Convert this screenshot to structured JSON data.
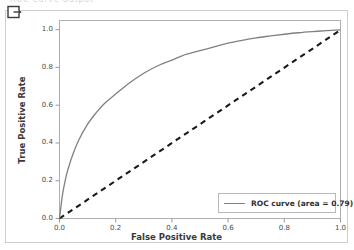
{
  "top_clip": {
    "ghost_text": "ROC Curve Output"
  },
  "toolbar": {
    "export_icon": "export-icon"
  },
  "colors": {
    "roc_curve": "#808080",
    "chance_line": "#1a1a1a",
    "frame": "#b0b0b0",
    "card_border": "#cfcfcf",
    "text": "#3a3a3a",
    "background": "#ffffff"
  },
  "chart_data": {
    "type": "line",
    "title": "",
    "xlabel": "False Positive Rate",
    "ylabel": "True Positive Rate",
    "xlim": [
      0.0,
      1.0
    ],
    "ylim": [
      0.0,
      1.05
    ],
    "grid": false,
    "legend_position": "lower right",
    "xticks": [
      "0.0",
      "0.2",
      "0.4",
      "0.6",
      "0.8",
      "1.0"
    ],
    "xtick_values": [
      0.0,
      0.2,
      0.4,
      0.6,
      0.8,
      1.0
    ],
    "yticks": [
      "0.0",
      "0.2",
      "0.4",
      "0.6",
      "0.8",
      "1.0"
    ],
    "ytick_values": [
      0.0,
      0.2,
      0.4,
      0.6,
      0.8,
      1.0
    ],
    "series": [
      {
        "name": "ROC curve (area = 0.79)",
        "legend_label": "ROC curve (area = 0.79)",
        "auc": 0.79,
        "style": "solid",
        "color": "#808080",
        "x": [
          0.0,
          0.01,
          0.02,
          0.03,
          0.05,
          0.07,
          0.1,
          0.13,
          0.16,
          0.2,
          0.25,
          0.3,
          0.35,
          0.4,
          0.45,
          0.5,
          0.55,
          0.6,
          0.65,
          0.7,
          0.75,
          0.8,
          0.85,
          0.9,
          0.95,
          1.0
        ],
        "y": [
          0.0,
          0.12,
          0.2,
          0.26,
          0.35,
          0.42,
          0.5,
          0.56,
          0.61,
          0.66,
          0.72,
          0.77,
          0.81,
          0.84,
          0.87,
          0.89,
          0.91,
          0.93,
          0.945,
          0.958,
          0.968,
          0.977,
          0.985,
          0.991,
          0.996,
          1.0
        ]
      },
      {
        "name": "chance",
        "legend_label": "",
        "style": "dashed",
        "color": "#1a1a1a",
        "x": [
          0.0,
          1.0
        ],
        "y": [
          0.0,
          1.0
        ]
      }
    ]
  }
}
